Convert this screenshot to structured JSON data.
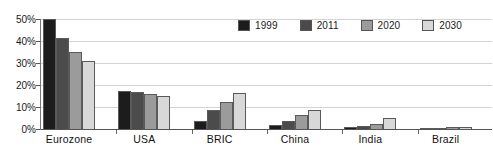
{
  "chart_data": {
    "type": "bar",
    "title": "",
    "subtitle": "",
    "xlabel": "",
    "ylabel": "",
    "ylim": [
      0,
      50
    ],
    "ytick_labels": [
      "50%",
      "40%",
      "30%",
      "20%",
      "10%",
      "0%"
    ],
    "ytick_values": [
      50,
      40,
      30,
      20,
      10,
      0
    ],
    "grid": true,
    "legend_position": "top-right",
    "categories": [
      "Eurozone",
      "USA",
      "BRIC",
      "China",
      "India",
      "Brazil"
    ],
    "series": [
      {
        "name": "1999",
        "color": "#1c1c1c",
        "values": [
          50.0,
          17.3,
          3.5,
          2.0,
          0.7,
          0.4
        ]
      },
      {
        "name": "2011",
        "color": "#4b4b4b",
        "values": [
          41.5,
          16.8,
          8.5,
          3.5,
          1.5,
          0.6
        ]
      },
      {
        "name": "2020",
        "color": "#9b9b9b",
        "values": [
          35.0,
          16.0,
          12.5,
          6.5,
          2.5,
          0.8
        ]
      },
      {
        "name": "2030",
        "color": "#d8d8d8",
        "values": [
          31.0,
          15.0,
          16.5,
          8.5,
          5.0,
          0.9
        ]
      }
    ]
  },
  "legend": {
    "items": [
      {
        "label": "1999",
        "color": "#1c1c1c"
      },
      {
        "label": "2011",
        "color": "#4b4b4b"
      },
      {
        "label": "2020",
        "color": "#9b9b9b"
      },
      {
        "label": "2030",
        "color": "#d8d8d8"
      }
    ]
  },
  "axes": {
    "y": {
      "ticks": [
        {
          "label": "50%",
          "value": 50
        },
        {
          "label": "40%",
          "value": 40
        },
        {
          "label": "30%",
          "value": 30
        },
        {
          "label": "20%",
          "value": 20
        },
        {
          "label": "10%",
          "value": 10
        },
        {
          "label": "0%",
          "value": 0
        }
      ]
    },
    "x": {
      "ticks": [
        "Eurozone",
        "USA",
        "BRIC",
        "China",
        "India",
        "Brazil"
      ]
    }
  },
  "colors": {
    "gridline": "#d3d3d3",
    "axis": "#555555",
    "background": "#ffffff",
    "bar_border": "#5a5a5a",
    "text": "#111111"
  }
}
